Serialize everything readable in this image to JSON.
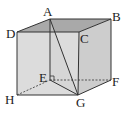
{
  "diagram": {
    "type": "cube",
    "vertices": {
      "A": {
        "label": "A",
        "x": 50,
        "y": 19
      },
      "B": {
        "label": "B",
        "x": 111,
        "y": 19
      },
      "C": {
        "label": "C",
        "x": 79,
        "y": 32
      },
      "D": {
        "label": "D",
        "x": 17,
        "y": 32
      },
      "E": {
        "label": "E",
        "x": 50,
        "y": 80
      },
      "F": {
        "label": "F",
        "x": 111,
        "y": 80
      },
      "G": {
        "label": "G",
        "x": 78,
        "y": 95
      },
      "H": {
        "label": "H",
        "x": 17,
        "y": 95
      }
    },
    "segments": [
      "AE",
      "AG",
      "EG"
    ],
    "hidden_edges": [
      "HE",
      "EF",
      "AE"
    ],
    "right_angle_at": "E",
    "colors": {
      "top_face": "#a9a9a9",
      "front_face": "#dcdcdc",
      "side_face": "#cdcdcd",
      "edge": "#333333"
    }
  }
}
